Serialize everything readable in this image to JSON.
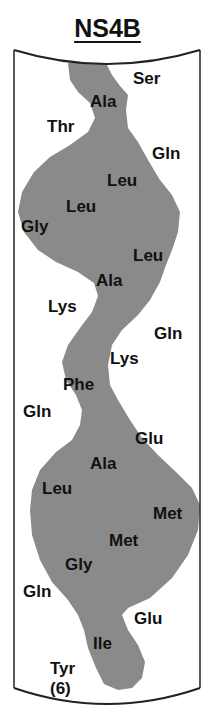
{
  "title": "NS4B",
  "colors": {
    "helix_fill": "#8a8a8a",
    "frame": "#222222",
    "text": "#111111"
  },
  "residues": [
    {
      "label": "Ser",
      "x": 133,
      "y": 70
    },
    {
      "label": "Ala",
      "x": 90,
      "y": 93
    },
    {
      "label": "Thr",
      "x": 47,
      "y": 118
    },
    {
      "label": "Gln",
      "x": 152,
      "y": 145
    },
    {
      "label": "Leu",
      "x": 107,
      "y": 172
    },
    {
      "label": "Leu",
      "x": 66,
      "y": 198
    },
    {
      "label": "Gly",
      "x": 21,
      "y": 218
    },
    {
      "label": "Leu",
      "x": 133,
      "y": 247
    },
    {
      "label": "Ala",
      "x": 96,
      "y": 272
    },
    {
      "label": "Lys",
      "x": 48,
      "y": 298
    },
    {
      "label": "Gln",
      "x": 154,
      "y": 325
    },
    {
      "label": "Lys",
      "x": 110,
      "y": 350
    },
    {
      "label": "Phe",
      "x": 63,
      "y": 376
    },
    {
      "label": "Gln",
      "x": 23,
      "y": 403
    },
    {
      "label": "Glu",
      "x": 135,
      "y": 430
    },
    {
      "label": "Ala",
      "x": 90,
      "y": 455
    },
    {
      "label": "Leu",
      "x": 42,
      "y": 480
    },
    {
      "label": "Met",
      "x": 153,
      "y": 505
    },
    {
      "label": "Met",
      "x": 109,
      "y": 532
    },
    {
      "label": "Gly",
      "x": 65,
      "y": 556
    },
    {
      "label": "Gln",
      "x": 23,
      "y": 583
    },
    {
      "label": "Glu",
      "x": 134,
      "y": 610
    },
    {
      "label": "Ile",
      "x": 93,
      "y": 635
    },
    {
      "label": "Tyr",
      "x": 50,
      "y": 660
    }
  ],
  "residue_count_label": "(6)"
}
